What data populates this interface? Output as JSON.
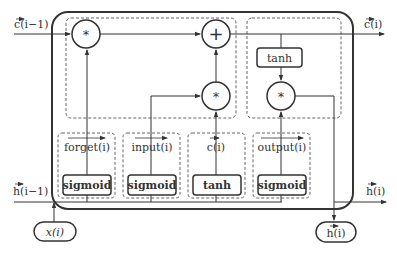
{
  "diagram": {
    "inputs": {
      "c_prev": "c(i−1)",
      "h_prev": "h(i−1)",
      "x": "x(i)"
    },
    "outputs": {
      "c": "c(i)",
      "h_right": "h(i)",
      "h_bottom": "h(i)"
    },
    "operators": {
      "forget_mul": "*",
      "add": "+",
      "input_mul": "*",
      "output_mul": "*"
    },
    "cell_tanh": "tanh",
    "gates": [
      {
        "label": "forget(i)",
        "activation": "sigmoid"
      },
      {
        "label": "input(i)",
        "activation": "sigmoid"
      },
      {
        "label": "c(i)",
        "activation": "tanh"
      },
      {
        "label": "output(i)",
        "activation": "sigmoid"
      }
    ],
    "colors": {
      "stroke": "#333333",
      "dash": "#555555",
      "background": "#ffffff"
    }
  }
}
